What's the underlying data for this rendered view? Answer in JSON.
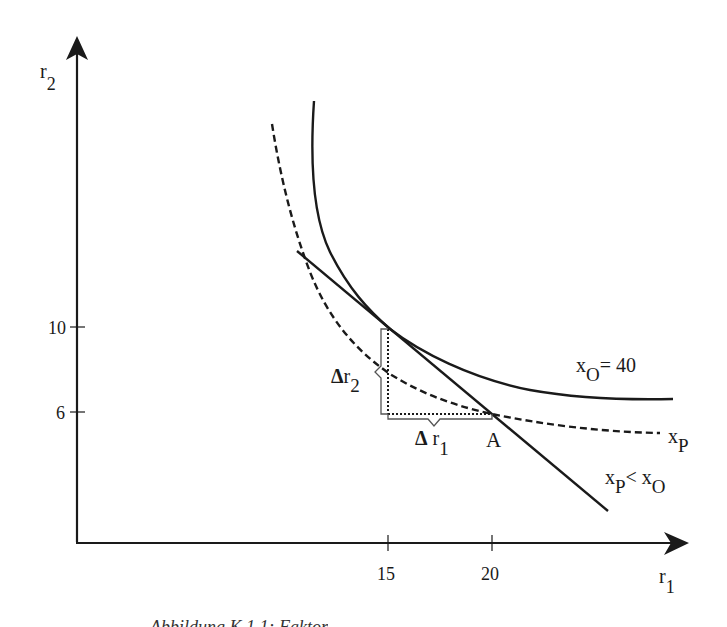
{
  "diagram": {
    "axes": {
      "y_label": {
        "base": "r",
        "sub": "2"
      },
      "x_label": {
        "base": "r",
        "sub": "1"
      },
      "y_ticks": [
        {
          "label": "10",
          "value": 10
        },
        {
          "label": "6",
          "value": 6
        }
      ],
      "x_ticks": [
        {
          "label": "15",
          "value": 15
        },
        {
          "label": "20",
          "value": 20
        }
      ]
    },
    "curves": [
      {
        "name": "isoquant-xO",
        "style": "solid",
        "label": {
          "base": "x",
          "sub": "O",
          "suffix": "= 40"
        }
      },
      {
        "name": "isoquant-xP",
        "style": "dashed",
        "label": {
          "base": "x",
          "sub": "P"
        }
      },
      {
        "name": "isocost-line",
        "style": "solid-straight"
      }
    ],
    "annotations": {
      "point_a": "A",
      "delta_r2": {
        "delta": "Δ",
        "base": "r",
        "sub": "2"
      },
      "delta_r1": {
        "delta": "Δ",
        "base": " r",
        "sub": "1"
      },
      "inequality": {
        "b1": "x",
        "s1": "P",
        "op": "< ",
        "b2": "x",
        "s2": "O"
      }
    },
    "caption": "Abbildung K.1.1: Faktor"
  },
  "colors": {
    "ink": "#1a1a1a",
    "background": "#ffffff"
  }
}
